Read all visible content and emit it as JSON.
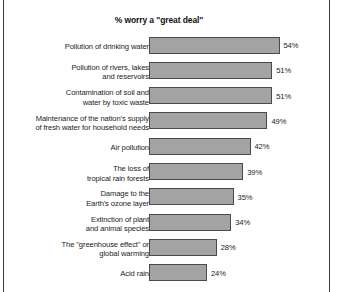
{
  "chart_data": {
    "type": "bar",
    "orientation": "horizontal",
    "title": "% worry a \"great deal\"",
    "xlabel": "",
    "ylabel": "",
    "xlim": [
      0,
      60
    ],
    "grid": false,
    "legend": null,
    "value_suffix": "%",
    "categories": [
      "Pollution of drinking water",
      "Pollution of rivers, lakes\nand reservoirs",
      "Contamination of soil and\nwater by toxic waste",
      "Maintenance of the nation's supply\nof fresh water for household needs",
      "Air pollution",
      "The loss of\ntropical rain forests",
      "Damage to the\nEarth's ozone layer",
      "Extinction of plant\nand animal species",
      "The \"greenhouse effect\" or\nglobal warming",
      "Acid rain"
    ],
    "values": [
      54,
      51,
      51,
      49,
      42,
      39,
      35,
      34,
      28,
      24
    ],
    "value_labels": [
      "54%",
      "51%",
      "51%",
      "49%",
      "42%",
      "39%",
      "35%",
      "34%",
      "28%",
      "24%"
    ],
    "colors": {
      "bar_fill": "#a3a3a3",
      "bar_stroke": "#4a4a4a",
      "text": "#1c1c1c",
      "background": "#ffffff",
      "frame_border": "#3a3a3a"
    }
  }
}
